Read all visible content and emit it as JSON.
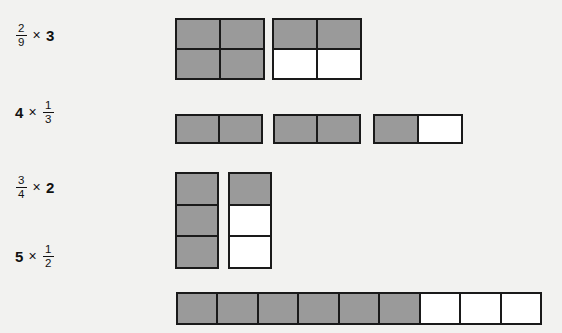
{
  "page": {
    "background_color": "#f2f2f0",
    "shaded_color": "#9a9a9a",
    "unshaded_color": "#ffffff",
    "border_color": "#1a1a1a"
  },
  "rows": [
    {
      "id": "row-1",
      "expression": {
        "text": "2/9 × 3",
        "fraction": {
          "numerator": "2",
          "denominator": "9"
        },
        "operator": "×",
        "whole": "3"
      },
      "model": {
        "type": "grid-blocks",
        "blocks": [
          {
            "columns": 2,
            "rows": 2,
            "shaded_cells": 4,
            "total_cells": 4
          },
          {
            "columns": 2,
            "rows": 2,
            "shaded_cells": 2,
            "total_cells": 4
          }
        ],
        "total_shaded": 6,
        "total_cells": 8
      }
    },
    {
      "id": "row-2",
      "expression": {
        "text": "4 × 1/3",
        "whole": "4",
        "operator": "×",
        "fraction": {
          "numerator": "1",
          "denominator": "3"
        }
      },
      "model": {
        "type": "horizontal-bars",
        "blocks": [
          {
            "columns": 2,
            "rows": 1,
            "shaded_cells": 2,
            "total_cells": 2
          },
          {
            "columns": 2,
            "rows": 1,
            "shaded_cells": 2,
            "total_cells": 2
          },
          {
            "columns": 2,
            "rows": 1,
            "shaded_cells": 1,
            "total_cells": 2
          }
        ],
        "total_shaded": 5,
        "total_cells": 6
      }
    },
    {
      "id": "row-3",
      "expression": {
        "text": "3/4 × 2",
        "fraction": {
          "numerator": "3",
          "denominator": "4"
        },
        "operator": "×",
        "whole": "2"
      },
      "model": {
        "type": "vertical-stacks",
        "blocks": [
          {
            "columns": 1,
            "rows": 3,
            "shaded_cells": 3,
            "total_cells": 3
          },
          {
            "columns": 1,
            "rows": 3,
            "shaded_cells": 1,
            "total_cells": 3
          }
        ],
        "total_shaded": 4,
        "total_cells": 6
      }
    },
    {
      "id": "row-4",
      "expression": {
        "text": "5 × 1/2",
        "whole": "5",
        "operator": "×",
        "fraction": {
          "numerator": "1",
          "denominator": "2"
        }
      },
      "model": {
        "type": "single-long-bar",
        "blocks": [
          {
            "columns": 9,
            "rows": 1,
            "shaded_cells": 6,
            "total_cells": 9
          }
        ],
        "total_shaded": 6,
        "total_cells": 9
      }
    }
  ]
}
